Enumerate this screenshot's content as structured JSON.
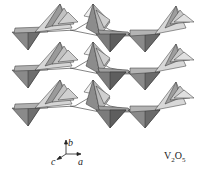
{
  "figure": {
    "compound_label": {
      "element1": "V",
      "sub1": "2",
      "element2": "O",
      "sub2": "5"
    },
    "axes": {
      "b": "b",
      "a": "a",
      "c": "c"
    },
    "layers": [
      {
        "id": "layer-1",
        "offset_y": 0
      },
      {
        "id": "layer-2",
        "offset_y": 38
      },
      {
        "id": "layer-3",
        "offset_y": 76
      }
    ],
    "colors": {
      "light_face": "#d4d4d4",
      "mid_face": "#a8a8a8",
      "dark_face": "#7a7a7a",
      "edge": "#333333"
    }
  }
}
